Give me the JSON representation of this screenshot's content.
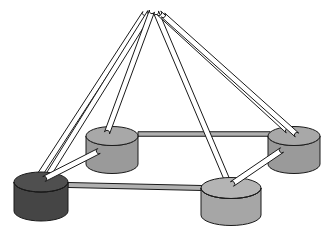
{
  "figure": {
    "background_color": "#ffffff",
    "stroke_color": "#1a1a1a",
    "stroke_width": 1,
    "width": 333,
    "height": 227
  },
  "palette": {
    "rod_fill": "#ffffff",
    "strut_fill": "#ffffff",
    "cylinder_dark_top": "#4f4f4f",
    "cylinder_dark_body": "#484848",
    "cylinder_dark_shade": "#3d3d3d",
    "cylinder_mid_top": "#a8a8a8",
    "cylinder_mid_body": "#9a9a9a",
    "cylinder_mid_shade": "#8c8c8c",
    "cylinder_light_top": "#b4b4b4",
    "cylinder_light_body": "#a6a6a6",
    "tie_fill": "#b0b0b0",
    "outline": "#1a1a1a"
  },
  "apex": {
    "label": "apex-node",
    "x": 150,
    "y": 10
  },
  "cylinders": [
    {
      "id": "node-back-left",
      "label": "Back left disc",
      "shade": "mid",
      "cx": 112,
      "cy": 136,
      "rx": 26,
      "ry": 9.5,
      "h": 28,
      "top_fill": "#a8a8a8",
      "body_fill": "#9a9a9a"
    },
    {
      "id": "node-back-right",
      "label": "Back right disc",
      "shade": "mid",
      "cx": 294,
      "cy": 136,
      "rx": 26,
      "ry": 9.5,
      "h": 28,
      "top_fill": "#a8a8a8",
      "body_fill": "#9a9a9a"
    },
    {
      "id": "node-front-left",
      "label": "Front left disc",
      "shade": "dark",
      "cx": 41,
      "cy": 182,
      "rx": 27,
      "ry": 10,
      "h": 29,
      "top_fill": "#4f4f4f",
      "body_fill": "#454545"
    },
    {
      "id": "node-front-right",
      "label": "Front right disc",
      "shade": "light",
      "cx": 231,
      "cy": 188,
      "rx": 30,
      "ry": 10.5,
      "h": 27,
      "top_fill": "#b4b4b4",
      "body_fill": "#a6a6a6"
    }
  ],
  "rods": [
    {
      "id": "rod-apex-to-front-left-a",
      "from": "apex",
      "to": "node-front-left",
      "x1": 145,
      "y1": 13,
      "x2": 39,
      "y2": 176,
      "w": 5.2
    },
    {
      "id": "rod-apex-to-front-left-b",
      "from": "apex",
      "to": "node-front-left",
      "x1": 150,
      "y1": 12,
      "x2": 47,
      "y2": 177,
      "w": 5.2
    },
    {
      "id": "rod-apex-to-back-left",
      "from": "apex",
      "to": "node-back-left",
      "x1": 152,
      "y1": 11,
      "x2": 107,
      "y2": 133,
      "w": 5.4
    },
    {
      "id": "rod-apex-to-front-right",
      "from": "apex",
      "to": "node-front-right",
      "x1": 156,
      "y1": 12,
      "x2": 228,
      "y2": 182,
      "w": 5.4
    },
    {
      "id": "rod-apex-to-back-right-a",
      "from": "apex",
      "to": "node-back-right",
      "x1": 159,
      "y1": 13,
      "x2": 288,
      "y2": 131,
      "w": 5.2
    },
    {
      "id": "rod-apex-to-back-right-b",
      "from": "apex",
      "to": "node-back-right",
      "x1": 163,
      "y1": 15,
      "x2": 297,
      "y2": 135,
      "w": 5.2
    }
  ],
  "struts": [
    {
      "id": "strut-back-left-to-front-left",
      "from": "node-back-left",
      "to": "node-front-left",
      "x1": 99,
      "y1": 151,
      "x2": 44,
      "y2": 179,
      "w": 5.5
    },
    {
      "id": "strut-back-right-to-front-right",
      "from": "node-back-right",
      "to": "node-front-right",
      "x1": 282,
      "y1": 150,
      "x2": 232,
      "y2": 184,
      "w": 5.5
    }
  ],
  "ties": [
    {
      "id": "tie-back-left-to-back-right",
      "from": "node-back-left",
      "to": "node-back-right",
      "x1": 138,
      "y1": 134,
      "x2": 270,
      "y2": 134,
      "w": 4.5
    },
    {
      "id": "tie-front-left-to-front-right",
      "from": "node-front-left",
      "to": "node-front-right",
      "x1": 68,
      "y1": 185,
      "x2": 202,
      "y2": 188,
      "w": 5.0
    }
  ],
  "annotations": {
    "caption": "",
    "node_count": 4,
    "rod_count": 6,
    "strut_count": 2,
    "tie_count": 2
  }
}
